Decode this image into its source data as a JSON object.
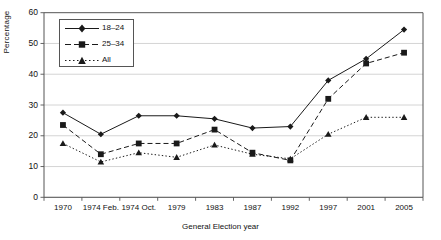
{
  "chart_data": {
    "type": "line",
    "title": "",
    "xlabel": "General Election year",
    "ylabel": "Percentage",
    "ylim": [
      0,
      60
    ],
    "ytick_step": 10,
    "grid": "horizontal",
    "legend_position": "top-left-inside",
    "categories": [
      "1970",
      "1974 Feb.",
      "1974 Oct.",
      "1979",
      "1983",
      "1987",
      "1992",
      "1997",
      "2001",
      "2005"
    ],
    "yticks": [
      "0",
      "10",
      "20",
      "30",
      "40",
      "50",
      "60"
    ],
    "series": [
      {
        "name": "18–24",
        "marker": "diamond",
        "line": "solid",
        "values": [
          27.5,
          20.5,
          26.5,
          26.5,
          25.5,
          22.5,
          23.0,
          38.0,
          45.0,
          54.5
        ]
      },
      {
        "name": "25–34",
        "marker": "square",
        "line": "dashed",
        "values": [
          23.5,
          14.0,
          17.5,
          17.5,
          22.0,
          14.5,
          12.0,
          32.0,
          43.5,
          47.0
        ]
      },
      {
        "name": "All",
        "marker": "triangle",
        "line": "dotted",
        "values": [
          17.5,
          11.5,
          14.5,
          13.0,
          17.0,
          14.0,
          12.5,
          20.5,
          26.0,
          26.0
        ]
      }
    ]
  },
  "axes": {
    "y_axis_label": "Percentage",
    "x_axis_label": "General Election year"
  },
  "legend": {
    "entries": [
      "18–24",
      "25–34",
      "All"
    ]
  },
  "colors": {
    "series_line": "#1a1a1a",
    "grid": "#c9c9c9",
    "axis": "#555555",
    "background": "#ffffff"
  }
}
